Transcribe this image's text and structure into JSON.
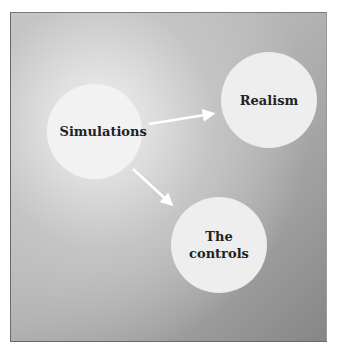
{
  "diagram": {
    "type": "concept-map",
    "background": {
      "style": "radial-gradient",
      "light_color": "#f0f0f0",
      "dark_color": "#868686"
    },
    "node_fill": "#eeeeee",
    "text_color": "#222222",
    "arrow_color": "#ffffff",
    "nodes": [
      {
        "id": "simulations",
        "label": "Simulations",
        "center": [
          94,
          132
        ],
        "radius": 47
      },
      {
        "id": "realism",
        "label": "Realism",
        "center": [
          269,
          100
        ],
        "radius": 48
      },
      {
        "id": "controls",
        "label": "The controls",
        "center": [
          219,
          245
        ],
        "radius": 48
      }
    ],
    "edges": [
      {
        "from": "simulations",
        "to": "realism"
      },
      {
        "from": "simulations",
        "to": "controls"
      }
    ]
  }
}
